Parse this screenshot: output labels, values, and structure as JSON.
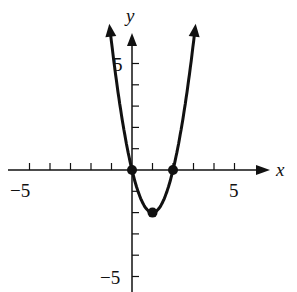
{
  "chart_data": {
    "type": "line",
    "title": "",
    "function": "y = 2x^2 - 4x",
    "xlabel": "x",
    "ylabel": "y",
    "xlim": [
      -6,
      6.5
    ],
    "ylim": [
      -5.5,
      6.8
    ],
    "x_tick_labels": [
      "-5",
      "5"
    ],
    "y_tick_labels": [
      "5",
      "-5"
    ],
    "x_ticks": [
      -5,
      -4,
      -3,
      -2,
      -1,
      1,
      2,
      3,
      4,
      5
    ],
    "y_ticks": [
      5,
      4,
      3,
      2,
      1,
      -1,
      -2,
      -3,
      -4,
      -5
    ],
    "grid": false,
    "series": [
      {
        "name": "parabola",
        "x": [
          -1.1,
          -0.5,
          0,
          0.5,
          1,
          1.5,
          2,
          2.5,
          3.1
        ],
        "y": [
          6.82,
          2.5,
          0,
          -1.5,
          -2,
          -1.5,
          0,
          2.5,
          8.82
        ]
      }
    ],
    "points": [
      {
        "label": "x-intercept",
        "x": 0,
        "y": 0
      },
      {
        "label": "vertex",
        "x": 1,
        "y": -2
      },
      {
        "label": "x-intercept",
        "x": 2,
        "y": 0
      }
    ]
  },
  "labels": {
    "x_axis": "x",
    "y_axis": "y",
    "x_neg5": "−5",
    "x_pos5": "5",
    "y_pos5": "5",
    "y_neg5": "−5"
  },
  "style": {
    "ink": "#111111"
  }
}
